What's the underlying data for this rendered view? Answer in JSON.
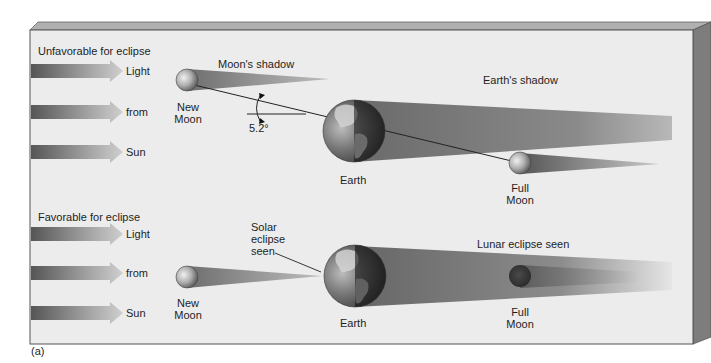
{
  "figure": {
    "label": "(a)",
    "colors": {
      "panel_bg": "#ebebeb",
      "panel_border": "#555555",
      "bevel_top": "#a8a8a8",
      "bevel_side": "#7a7a7a",
      "arrow_dark": "#5a5a5a",
      "arrow_light": "#c4c4c4",
      "shadow": "#6f6f6f",
      "earth_ocean": "#4a4a4a",
      "earth_land": "#cfcfcf"
    }
  },
  "top_panel": {
    "title": "Unfavorable for eclipse",
    "sun_arrows": [
      "Light",
      "from",
      "Sun"
    ],
    "new_moon_label_1": "New",
    "new_moon_label_2": "Moon",
    "moon_shadow_label": "Moon's shadow",
    "angle_label": "5.2°",
    "earth_label": "Earth",
    "earth_shadow_label": "Earth's shadow",
    "full_moon_label_1": "Full",
    "full_moon_label_2": "Moon"
  },
  "bottom_panel": {
    "title": "Favorable for eclipse",
    "sun_arrows": [
      "Light",
      "from",
      "Sun"
    ],
    "new_moon_label_1": "New",
    "new_moon_label_2": "Moon",
    "solar_eclipse_label_1": "Solar",
    "solar_eclipse_label_2": "eclipse",
    "solar_eclipse_label_3": "seen",
    "earth_label": "Earth",
    "lunar_eclipse_label": "Lunar eclipse seen",
    "full_moon_label_1": "Full",
    "full_moon_label_2": "Moon"
  }
}
